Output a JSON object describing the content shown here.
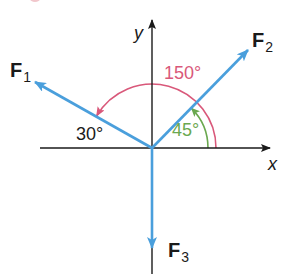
{
  "diagram": {
    "colors": {
      "axis": "#1a1a1a",
      "vector": "#4a9fdc",
      "arc_150": "#d9587a",
      "arc_45": "#6aa84f",
      "text": "#1a1a1a"
    },
    "axes": {
      "x_label": "x",
      "y_label": "y"
    },
    "vectors": [
      {
        "id": "F1",
        "label": "F",
        "subscript": "1",
        "direction_deg": 150
      },
      {
        "id": "F2",
        "label": "F",
        "subscript": "2",
        "direction_deg": 45
      },
      {
        "id": "F3",
        "label": "F",
        "subscript": "3",
        "direction_deg": 270
      }
    ],
    "angles": {
      "large": "150°",
      "small": "45°",
      "reference": "30°"
    }
  }
}
